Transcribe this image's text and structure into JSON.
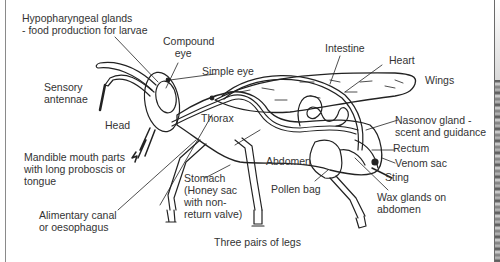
{
  "diagram": {
    "colors": {
      "line": "#222222",
      "text": "#333333",
      "background": "#ffffff"
    },
    "labels": {
      "hypopharyngeal": "Hypopharyngeal glands\n- food production for larvae",
      "compound_eye": "Compound\n    eye",
      "simple_eye": "Simple eye",
      "sensory_antennae": "Sensory\nantennae",
      "head": "Head",
      "thorax": "Thorax",
      "intestine": "Intestine",
      "heart": "Heart",
      "wings": "Wings",
      "nasonov": "Nasonov gland -\nscent and guidance",
      "rectum": "Rectum",
      "venom_sac": "Venom sac",
      "sting": "Sting",
      "abdomen": "Abdomen",
      "mandible": "Mandible mouth parts\nwith long proboscis or\ntongue",
      "stomach": "Stomach\n(Honey sac\nwith non-\nreturn valve)",
      "pollen_bag": "Pollen bag",
      "wax_glands": "Wax glands on\nabdomen",
      "alimentary": "Alimentary canal\nor oesophagus",
      "legs": "Three pairs of legs"
    }
  }
}
